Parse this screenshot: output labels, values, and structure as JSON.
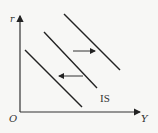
{
  "diagram": {
    "axes": {
      "y_label": "r",
      "x_label": "Y",
      "origin_label": "O"
    },
    "curve_label": "IS",
    "curves": [
      {
        "name": "IS-shifted-left",
        "x1": 25,
        "y1": 50,
        "x2": 82,
        "y2": 107
      },
      {
        "name": "IS",
        "x1": 44,
        "y1": 32,
        "x2": 97,
        "y2": 88
      },
      {
        "name": "IS-shifted-right",
        "x1": 64,
        "y1": 14,
        "x2": 120,
        "y2": 70
      }
    ],
    "arrows": [
      {
        "name": "shift-right-arrow",
        "direction": "right"
      },
      {
        "name": "shift-left-arrow",
        "direction": "left"
      }
    ],
    "colors": {
      "line": "#222222",
      "background": "#f7f7f5"
    }
  }
}
